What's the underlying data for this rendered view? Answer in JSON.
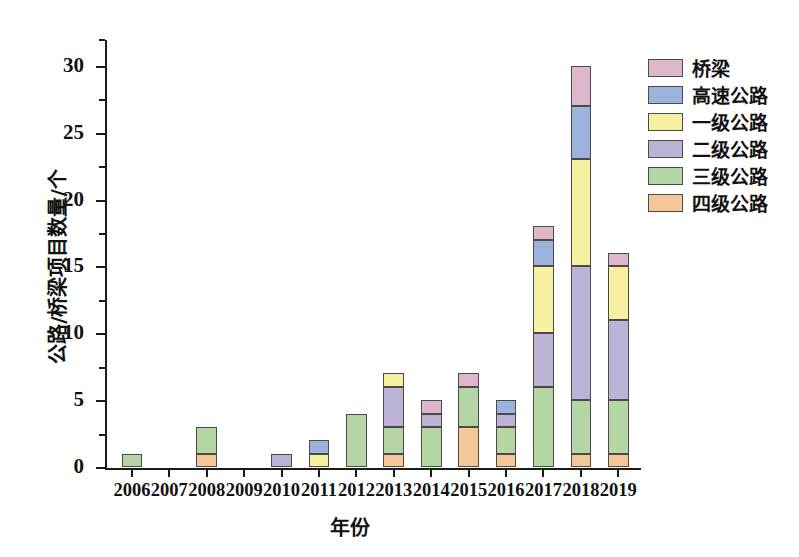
{
  "chart_data": {
    "type": "bar",
    "stacked": true,
    "title": "",
    "xlabel": "年份",
    "ylabel": "公路/桥梁项目数量/个",
    "categories": [
      "2006",
      "2007",
      "2008",
      "2009",
      "2010",
      "2011",
      "2012",
      "2013",
      "2014",
      "2015",
      "2016",
      "2017",
      "2018",
      "2019"
    ],
    "ylim": [
      0,
      32
    ],
    "y_ticks": [
      0,
      5,
      10,
      15,
      20,
      25,
      30
    ],
    "y_tick_labels": [
      "0",
      "5",
      "10",
      "15",
      "20",
      "25",
      "30"
    ],
    "y_minor_ticks": [
      2.5,
      7.5,
      12.5,
      17.5,
      22.5,
      27.5,
      32
    ],
    "grid": false,
    "legend_position": "right-top",
    "series": [
      {
        "name": "四级公路",
        "color": "#f5c797",
        "values": [
          0,
          0,
          1,
          0,
          0,
          0,
          0,
          1,
          0,
          3,
          1,
          0,
          1,
          1
        ]
      },
      {
        "name": "三级公路",
        "color": "#b4d6a4",
        "values": [
          1,
          0,
          2,
          0,
          0,
          0,
          4,
          2,
          3,
          3,
          2,
          6,
          4,
          4
        ]
      },
      {
        "name": "二级公路",
        "color": "#bcb2d6",
        "values": [
          0,
          0,
          0,
          0,
          1,
          0,
          0,
          3,
          1,
          0,
          1,
          4,
          10,
          6
        ]
      },
      {
        "name": "一级公路",
        "color": "#f7f0a0",
        "values": [
          0,
          0,
          0,
          0,
          0,
          1,
          0,
          1,
          0,
          0,
          0,
          5,
          8,
          4
        ]
      },
      {
        "name": "高速公路",
        "color": "#9cb4dd",
        "values": [
          0,
          0,
          0,
          0,
          0,
          1,
          0,
          0,
          0,
          0,
          1,
          2,
          4,
          0
        ]
      },
      {
        "name": "桥梁",
        "color": "#ddb8cd",
        "values": [
          0,
          0,
          0,
          0,
          0,
          0,
          0,
          0,
          1,
          1,
          0,
          1,
          3,
          1
        ]
      }
    ],
    "totals": [
      1,
      0,
      3,
      0,
      1,
      2,
      4,
      7,
      5,
      7,
      5,
      18,
      30,
      16
    ]
  },
  "legend": {
    "items": [
      {
        "label": "桥梁",
        "color": "#ddb8cd"
      },
      {
        "label": "高速公路",
        "color": "#9cb4dd"
      },
      {
        "label": "一级公路",
        "color": "#f7f0a0"
      },
      {
        "label": "二级公路",
        "color": "#bcb2d6"
      },
      {
        "label": "三级公路",
        "color": "#b4d6a4"
      },
      {
        "label": "四级公路",
        "color": "#f5c797"
      }
    ]
  },
  "axis_colors": {
    "axis": "#1a1a1a",
    "bar_border": "#4a4a48",
    "background": "#ffffff"
  }
}
